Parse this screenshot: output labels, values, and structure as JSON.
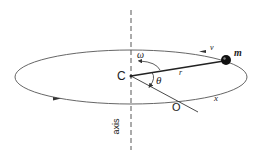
{
  "diagram": {
    "type": "circular-motion",
    "labels": {
      "center": "C",
      "mass": "m",
      "radius": "r",
      "velocity": "v",
      "angle": "θ",
      "angular_velocity": "ω",
      "reference_point": "O",
      "x_axis": "x",
      "axis": "axis"
    },
    "colors": {
      "line": "#333333",
      "ellipse": "#555555",
      "mass_fill": "#111111",
      "background": "#ffffff"
    }
  }
}
